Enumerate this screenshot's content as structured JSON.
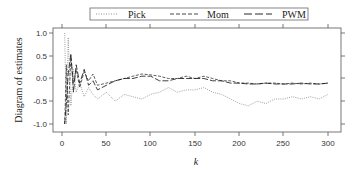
{
  "chart_data": {
    "type": "line",
    "title": "",
    "xlabel": "k",
    "ylabel": "Diagram of estimates",
    "xlim": [
      0,
      310
    ],
    "ylim": [
      -1.05,
      1.05
    ],
    "xticks": [
      0,
      50,
      100,
      150,
      200,
      250,
      300
    ],
    "yticks": [
      1.0,
      0.5,
      0.0,
      -0.5,
      -1.0
    ],
    "xtick_labels": [
      "0",
      "50",
      "100",
      "150",
      "200",
      "250",
      "300"
    ],
    "ytick_labels": [
      "1.0",
      "0.5",
      "0.0",
      "-0.5",
      "-1.0"
    ],
    "grid": false,
    "legend_position": "top",
    "legend": [
      {
        "name": "Pick",
        "style": "dotted",
        "color": "#888888"
      },
      {
        "name": "Mom",
        "style": "dashed",
        "color": "#333333"
      },
      {
        "name": "PWM",
        "style": "longdash",
        "color": "#111111"
      }
    ],
    "series": [
      {
        "name": "Pick",
        "x": [
          3,
          5,
          7,
          10,
          13,
          16,
          20,
          25,
          30,
          35,
          40,
          50,
          60,
          70,
          80,
          90,
          100,
          110,
          120,
          130,
          140,
          150,
          160,
          170,
          180,
          190,
          200,
          210,
          220,
          230,
          240,
          250,
          260,
          270,
          280,
          290,
          300
        ],
        "values": [
          1.0,
          -1.0,
          0.9,
          -0.6,
          0.2,
          -0.3,
          -0.1,
          -0.4,
          -0.2,
          -0.35,
          -0.45,
          -0.3,
          -0.5,
          -0.35,
          -0.4,
          -0.45,
          -0.35,
          -0.3,
          -0.2,
          -0.3,
          -0.25,
          -0.25,
          -0.2,
          -0.3,
          -0.35,
          -0.45,
          -0.55,
          -0.6,
          -0.5,
          -0.55,
          -0.45,
          -0.45,
          -0.4,
          -0.45,
          -0.4,
          -0.45,
          -0.35
        ]
      },
      {
        "name": "Mom",
        "x": [
          3,
          5,
          7,
          10,
          13,
          16,
          20,
          25,
          30,
          35,
          40,
          50,
          60,
          70,
          80,
          90,
          100,
          110,
          120,
          130,
          140,
          150,
          160,
          170,
          180,
          190,
          200,
          210,
          220,
          230,
          240,
          250,
          260,
          270,
          280,
          290,
          300
        ],
        "values": [
          -1.0,
          0.3,
          -0.8,
          0.45,
          -0.1,
          0.2,
          -0.2,
          0.15,
          -0.05,
          0.1,
          -0.15,
          -0.1,
          -0.05,
          0.0,
          0.05,
          0.1,
          0.08,
          0.05,
          0.0,
          0.0,
          0.05,
          0.0,
          0.05,
          0.0,
          -0.05,
          -0.05,
          -0.1,
          -0.1,
          -0.12,
          -0.1,
          -0.1,
          -0.12,
          -0.1,
          -0.12,
          -0.1,
          -0.12,
          -0.1
        ]
      },
      {
        "name": "PWM",
        "x": [
          3,
          5,
          7,
          10,
          13,
          16,
          20,
          25,
          30,
          35,
          40,
          50,
          60,
          70,
          80,
          90,
          100,
          110,
          120,
          130,
          140,
          150,
          160,
          170,
          180,
          190,
          200,
          210,
          220,
          230,
          240,
          250,
          260,
          270,
          280,
          290,
          300
        ],
        "values": [
          -1.0,
          -0.5,
          0.1,
          0.55,
          -0.3,
          0.3,
          -0.1,
          0.2,
          -0.15,
          -0.05,
          -0.25,
          -0.15,
          -0.05,
          0.0,
          0.0,
          0.05,
          0.05,
          -0.05,
          -0.05,
          0.0,
          0.0,
          0.0,
          0.0,
          -0.05,
          -0.05,
          -0.1,
          -0.1,
          -0.12,
          -0.12,
          -0.1,
          -0.12,
          -0.12,
          -0.12,
          -0.1,
          -0.12,
          -0.12,
          -0.1
        ]
      }
    ]
  },
  "axes": {
    "xlabel": "k",
    "ylabel": "Diagram of estimates",
    "xtick_labels": [
      "0",
      "50",
      "100",
      "150",
      "200",
      "250",
      "300"
    ],
    "ytick_labels": [
      "1.0",
      "0.5",
      "0.0",
      "-0.5",
      "-1.0"
    ]
  },
  "legend": {
    "items": [
      {
        "label": "Pick"
      },
      {
        "label": "Mom"
      },
      {
        "label": "PWM"
      }
    ]
  }
}
